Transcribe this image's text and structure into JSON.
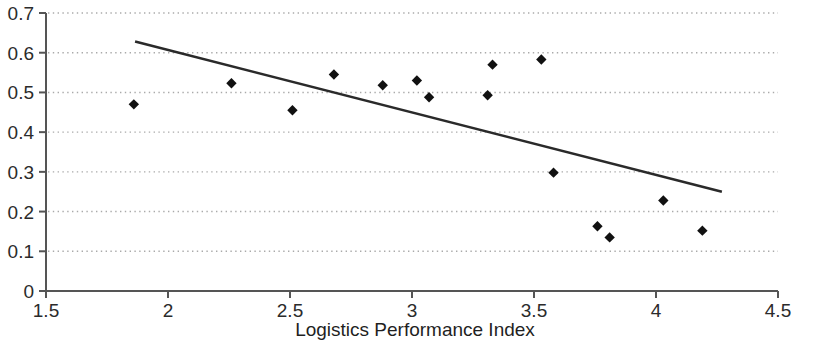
{
  "chart_data": {
    "type": "scatter",
    "title": "",
    "xlabel": "Logistics Performance Index",
    "ylabel": "",
    "xlim": [
      1.5,
      4.5
    ],
    "ylim": [
      0,
      0.7
    ],
    "xticks": [
      "1.5",
      "2",
      "2.5",
      "3",
      "3.5",
      "4",
      "4.5"
    ],
    "xtick_values": [
      1.5,
      2,
      2.5,
      3,
      3.5,
      4,
      4.5
    ],
    "yticks": [
      "0",
      "0.1",
      "0.2",
      "0.3",
      "0.4",
      "0.5",
      "0.6",
      "0.7"
    ],
    "ytick_values": [
      0,
      0.1,
      0.2,
      0.3,
      0.4,
      0.5,
      0.6,
      0.7
    ],
    "grid": "horizontal-dotted",
    "legend": "none",
    "marker": "filled-diamond",
    "marker_color": "#111111",
    "axis_color": "#555555",
    "grid_color": "#aaaaaa",
    "points": [
      {
        "x": 1.86,
        "y": 0.47
      },
      {
        "x": 2.26,
        "y": 0.523
      },
      {
        "x": 2.51,
        "y": 0.455
      },
      {
        "x": 2.68,
        "y": 0.545
      },
      {
        "x": 2.88,
        "y": 0.518
      },
      {
        "x": 3.02,
        "y": 0.53
      },
      {
        "x": 3.07,
        "y": 0.488
      },
      {
        "x": 3.33,
        "y": 0.57
      },
      {
        "x": 3.31,
        "y": 0.493
      },
      {
        "x": 3.53,
        "y": 0.583
      },
      {
        "x": 3.58,
        "y": 0.298
      },
      {
        "x": 3.76,
        "y": 0.163
      },
      {
        "x": 3.81,
        "y": 0.135
      },
      {
        "x": 4.03,
        "y": 0.228
      },
      {
        "x": 4.19,
        "y": 0.152
      }
    ],
    "trendline": {
      "type": "linear",
      "color": "#2a2a2a",
      "x_start": 1.865,
      "y_start": 0.628,
      "x_end": 4.27,
      "y_end": 0.25
    }
  }
}
